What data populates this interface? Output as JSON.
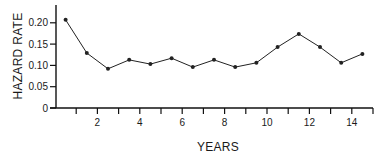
{
  "chart_data": {
    "type": "line",
    "title": "",
    "xlabel": "YEARS",
    "ylabel": "HAZARD RATE",
    "xlim": [
      0,
      15
    ],
    "ylim": [
      0,
      0.23
    ],
    "x_ticks": [
      1,
      2,
      3,
      4,
      5,
      6,
      7,
      8,
      9,
      10,
      11,
      12,
      13,
      14,
      15
    ],
    "x_tick_labels": [
      "",
      "2",
      "",
      "4",
      "",
      "6",
      "",
      "8",
      "",
      "10",
      "",
      "12",
      "",
      "14",
      ""
    ],
    "y_ticks": [
      0,
      0.05,
      0.1,
      0.15,
      0.2
    ],
    "y_tick_labels": [
      "0",
      "0.05",
      "0.10",
      "0.15",
      "0.20"
    ],
    "grid": false,
    "legend": null,
    "x": [
      0.5,
      1.5,
      2.5,
      3.5,
      4.5,
      5.5,
      6.5,
      7.5,
      8.5,
      9.5,
      10.5,
      11.5,
      12.5,
      13.5,
      14.5
    ],
    "series": [
      {
        "name": "Hazard rate",
        "values": [
          0.207,
          0.129,
          0.092,
          0.113,
          0.103,
          0.117,
          0.096,
          0.113,
          0.096,
          0.106,
          0.143,
          0.174,
          0.143,
          0.106,
          0.127
        ]
      }
    ],
    "colors": {
      "line": "#222222",
      "axis": "#111111",
      "text": "#1a1a1a"
    }
  }
}
